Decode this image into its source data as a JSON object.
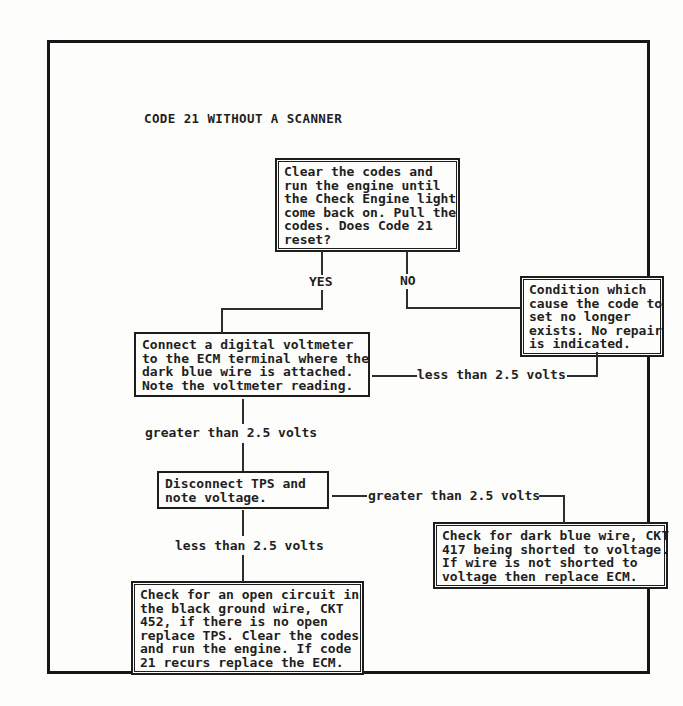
{
  "title": "CODE 21 WITHOUT A SCANNER",
  "colors": {
    "paper": "#fdfdfb",
    "ink": "#1f1f1f",
    "line": "#2e2e2e"
  },
  "flowchart": {
    "nodes": [
      {
        "id": "start",
        "text": "Clear the codes and\nrun the engine until\nthe Check Engine light\ncome back on. Pull the\ncodes. Does Code 21\nreset?"
      },
      {
        "id": "no-repair",
        "text": "Condition which\ncause the code to\nset no longer\nexists. No repair\nis indicated."
      },
      {
        "id": "voltmeter",
        "text": "Connect a digital voltmeter\nto the ECM terminal where the\ndark blue wire is attached.\nNote the voltmeter reading."
      },
      {
        "id": "disconnect-tps",
        "text": "Disconnect TPS and\nnote voltage."
      },
      {
        "id": "ckt417-short",
        "text": "Check for dark blue wire, CKT\n417 being shorted to voltage.\nIf wire is not shorted to\nvoltage then replace ECM."
      },
      {
        "id": "ckt452-open",
        "text": "Check for an open circuit in\nthe black ground wire, CKT\n452, if there is no open\nreplace TPS. Clear the codes\nand run the engine. If code\n21 recurs replace the ECM."
      }
    ],
    "edges": [
      {
        "from": "start",
        "to": "voltmeter",
        "label": "YES"
      },
      {
        "from": "start",
        "to": "no-repair",
        "label": "NO"
      },
      {
        "from": "voltmeter",
        "to": "no-repair",
        "label": "less than 2.5 volts"
      },
      {
        "from": "voltmeter",
        "to": "disconnect-tps",
        "label": "greater than 2.5 volts"
      },
      {
        "from": "disconnect-tps",
        "to": "ckt417-short",
        "label": "greater than 2.5 volts"
      },
      {
        "from": "disconnect-tps",
        "to": "ckt452-open",
        "label": "less than 2.5 volts"
      }
    ]
  }
}
